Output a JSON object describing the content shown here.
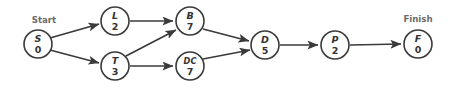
{
  "diagram": {
    "type": "activity-on-node-network",
    "width": 454,
    "height": 88,
    "colors": {
      "background": "#ffffff",
      "node_stroke": "#3a3a3a",
      "node_fill": "#ffffff",
      "node_text": "#333333",
      "edge": "#3a3a3a",
      "caption": "#6b6b6b"
    },
    "captions": {
      "start": "Start",
      "finish": "Finish"
    },
    "nodes": [
      {
        "id": "S",
        "label": "S",
        "duration": "0",
        "cx": 38,
        "cy": 44,
        "r": 14
      },
      {
        "id": "L",
        "label": "L",
        "duration": "2",
        "cx": 115,
        "cy": 21,
        "r": 14
      },
      {
        "id": "T",
        "label": "T",
        "duration": "3",
        "cx": 115,
        "cy": 66,
        "r": 14
      },
      {
        "id": "B",
        "label": "B",
        "duration": "7",
        "cx": 190,
        "cy": 21,
        "r": 14
      },
      {
        "id": "DC",
        "label": "DC",
        "duration": "7",
        "cx": 190,
        "cy": 66,
        "r": 14
      },
      {
        "id": "D",
        "label": "D",
        "duration": "5",
        "cx": 265,
        "cy": 45,
        "r": 14
      },
      {
        "id": "P",
        "label": "P",
        "duration": "2",
        "cx": 335,
        "cy": 45,
        "r": 14
      },
      {
        "id": "F",
        "label": "F",
        "duration": "0",
        "cx": 418,
        "cy": 44,
        "r": 14
      }
    ],
    "edges": [
      {
        "from": "S",
        "to": "L"
      },
      {
        "from": "S",
        "to": "T"
      },
      {
        "from": "L",
        "to": "B"
      },
      {
        "from": "T",
        "to": "B"
      },
      {
        "from": "T",
        "to": "DC"
      },
      {
        "from": "B",
        "to": "D"
      },
      {
        "from": "DC",
        "to": "D"
      },
      {
        "from": "D",
        "to": "P"
      },
      {
        "from": "P",
        "to": "F"
      }
    ]
  }
}
